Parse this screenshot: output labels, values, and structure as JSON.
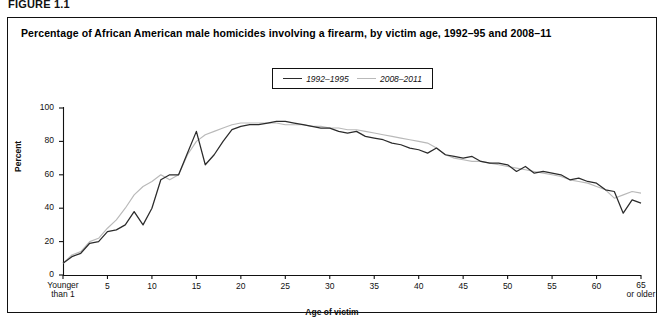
{
  "figure_label": "FIGURE 1.1",
  "chart_title": "Percentage of African American male homicides involving a firearm, by victim age, 1992–95 and 2008–11",
  "legend": {
    "items": [
      {
        "label": "1992–1995",
        "color": "#2b2b2b"
      },
      {
        "label": "2008–2011",
        "color": "#b9b9b9"
      }
    ]
  },
  "axes": {
    "y_title": "Percent",
    "x_title": "Age of victim",
    "y_ticks": [
      "0",
      "20",
      "40",
      "60",
      "80",
      "100"
    ],
    "x_ticks": [
      "Younger than 1",
      "5",
      "10",
      "15",
      "20",
      "25",
      "30",
      "35",
      "40",
      "45",
      "50",
      "55",
      "60",
      "65 or older"
    ]
  },
  "chart_data": {
    "type": "line",
    "title": "Percentage of African American male homicides involving a firearm, by victim age, 1992–95 and 2008–11",
    "xlabel": "Age of victim",
    "ylabel": "Percent",
    "xlim": [
      0,
      65
    ],
    "ylim": [
      0,
      100
    ],
    "grid": false,
    "legend_position": "top-center",
    "x": [
      0,
      1,
      2,
      3,
      4,
      5,
      6,
      7,
      8,
      9,
      10,
      11,
      12,
      13,
      14,
      15,
      16,
      17,
      18,
      19,
      20,
      21,
      22,
      23,
      24,
      25,
      26,
      27,
      28,
      29,
      30,
      31,
      32,
      33,
      34,
      35,
      36,
      37,
      38,
      39,
      40,
      41,
      42,
      43,
      44,
      45,
      46,
      47,
      48,
      49,
      50,
      51,
      52,
      53,
      54,
      55,
      56,
      57,
      58,
      59,
      60,
      61,
      62,
      63,
      64,
      65
    ],
    "series": [
      {
        "name": "1992–1995",
        "color": "#2b2b2b",
        "values": [
          7,
          8,
          12,
          13,
          19,
          24,
          26,
          25,
          30,
          44,
          38,
          54,
          60,
          59,
          71,
          86,
          66,
          76,
          84,
          87,
          89,
          89,
          90,
          91,
          92,
          92,
          91,
          91,
          90,
          90,
          89,
          89,
          88,
          87,
          87,
          86,
          86,
          85,
          84,
          83,
          82,
          82,
          80,
          80,
          80,
          79,
          78,
          77,
          76,
          75,
          74,
          73,
          72,
          71,
          70,
          71,
          69,
          70,
          69,
          70,
          68,
          66,
          65,
          67,
          68,
          66
        ]
      },
      {
        "name": "2008–2011",
        "color": "#b9b9b9",
        "values": [
          7,
          9,
          13,
          15,
          20,
          25,
          28,
          31,
          40,
          50,
          56,
          60,
          62,
          62,
          66,
          67,
          63,
          63,
          77,
          85,
          89,
          90,
          91,
          91,
          92,
          92,
          92,
          92,
          91,
          91,
          90,
          90,
          90,
          89,
          89,
          88,
          88,
          87,
          87,
          86,
          86,
          85,
          85,
          84,
          84,
          83,
          83,
          82,
          81,
          80,
          79,
          78,
          77,
          76,
          75,
          74,
          73,
          72,
          71,
          70,
          69,
          68,
          67,
          66,
          65,
          64
        ]
      }
    ],
    "series_detail": {
      "1992–1995": {
        "age_value_pairs": [
          [
            0,
            7
          ],
          [
            1,
            11
          ],
          [
            2,
            13
          ],
          [
            3,
            19
          ],
          [
            4,
            20
          ],
          [
            5,
            26
          ],
          [
            6,
            27
          ],
          [
            7,
            30
          ],
          [
            8,
            38
          ],
          [
            9,
            30
          ],
          [
            10,
            40
          ],
          [
            11,
            57
          ],
          [
            12,
            60
          ],
          [
            13,
            60
          ],
          [
            14,
            73
          ],
          [
            15,
            86
          ],
          [
            16,
            66
          ],
          [
            17,
            72
          ],
          [
            18,
            80
          ],
          [
            19,
            87
          ],
          [
            20,
            89
          ],
          [
            21,
            90
          ],
          [
            22,
            90
          ],
          [
            23,
            91
          ],
          [
            24,
            92
          ],
          [
            25,
            92
          ],
          [
            26,
            91
          ],
          [
            27,
            90
          ],
          [
            28,
            89
          ],
          [
            29,
            88
          ],
          [
            30,
            88
          ],
          [
            31,
            86
          ],
          [
            32,
            85
          ],
          [
            33,
            86
          ],
          [
            34,
            83
          ],
          [
            35,
            82
          ],
          [
            36,
            81
          ],
          [
            37,
            79
          ],
          [
            38,
            78
          ],
          [
            39,
            76
          ],
          [
            40,
            75
          ],
          [
            41,
            73
          ],
          [
            42,
            76
          ],
          [
            43,
            72
          ],
          [
            44,
            71
          ],
          [
            45,
            70
          ],
          [
            46,
            71
          ],
          [
            47,
            68
          ],
          [
            48,
            67
          ],
          [
            49,
            67
          ],
          [
            50,
            66
          ],
          [
            51,
            62
          ],
          [
            52,
            65
          ],
          [
            53,
            61
          ],
          [
            54,
            62
          ],
          [
            55,
            61
          ],
          [
            56,
            60
          ],
          [
            57,
            57
          ],
          [
            58,
            58
          ],
          [
            59,
            56
          ],
          [
            60,
            55
          ],
          [
            61,
            51
          ],
          [
            62,
            50
          ],
          [
            63,
            37
          ],
          [
            64,
            45
          ],
          [
            65,
            43
          ]
        ]
      },
      "2008–2011": {
        "age_value_pairs": [
          [
            0,
            7
          ],
          [
            1,
            12
          ],
          [
            2,
            14
          ],
          [
            3,
            20
          ],
          [
            4,
            22
          ],
          [
            5,
            28
          ],
          [
            6,
            33
          ],
          [
            7,
            40
          ],
          [
            8,
            48
          ],
          [
            9,
            53
          ],
          [
            10,
            56
          ],
          [
            11,
            60
          ],
          [
            12,
            57
          ],
          [
            13,
            60
          ],
          [
            14,
            72
          ],
          [
            15,
            80
          ],
          [
            16,
            84
          ],
          [
            17,
            86
          ],
          [
            18,
            88
          ],
          [
            19,
            90
          ],
          [
            20,
            91
          ],
          [
            21,
            91
          ],
          [
            22,
            91
          ],
          [
            23,
            91
          ],
          [
            24,
            91
          ],
          [
            25,
            90
          ],
          [
            26,
            90
          ],
          [
            27,
            90
          ],
          [
            28,
            89
          ],
          [
            29,
            89
          ],
          [
            30,
            88
          ],
          [
            31,
            88
          ],
          [
            32,
            87
          ],
          [
            33,
            87
          ],
          [
            34,
            86
          ],
          [
            35,
            85
          ],
          [
            36,
            84
          ],
          [
            37,
            83
          ],
          [
            38,
            82
          ],
          [
            39,
            81
          ],
          [
            40,
            80
          ],
          [
            41,
            79
          ],
          [
            42,
            76
          ],
          [
            43,
            72
          ],
          [
            44,
            70
          ],
          [
            45,
            69
          ],
          [
            46,
            68
          ],
          [
            47,
            68
          ],
          [
            48,
            67
          ],
          [
            49,
            66
          ],
          [
            50,
            65
          ],
          [
            51,
            64
          ],
          [
            52,
            63
          ],
          [
            53,
            62
          ],
          [
            54,
            61
          ],
          [
            55,
            60
          ],
          [
            56,
            59
          ],
          [
            57,
            57
          ],
          [
            58,
            56
          ],
          [
            59,
            55
          ],
          [
            60,
            53
          ],
          [
            61,
            51
          ],
          [
            62,
            46
          ],
          [
            63,
            48
          ],
          [
            64,
            50
          ],
          [
            65,
            49
          ]
        ]
      }
    }
  }
}
